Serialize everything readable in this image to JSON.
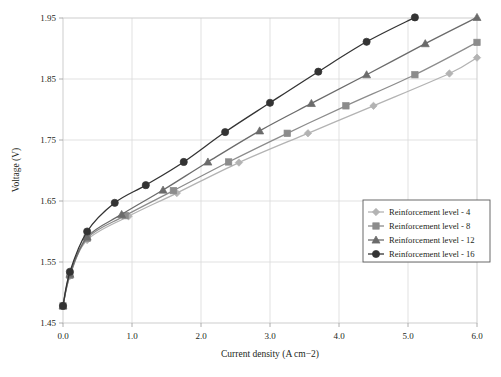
{
  "chart_data": {
    "type": "line",
    "title": "",
    "xlabel": "Current density (A cm−2)",
    "ylabel": "Voltage (V)",
    "xlim": [
      0.0,
      6.0
    ],
    "ylim": [
      1.45,
      1.95
    ],
    "xticks": [
      "0.0",
      "1.0",
      "2.0",
      "3.0",
      "4.0",
      "5.0",
      "6.0"
    ],
    "yticks": [
      "1.45",
      "1.55",
      "1.65",
      "1.75",
      "1.85",
      "1.95"
    ],
    "grid": true,
    "legend_position": "lower right",
    "series": [
      {
        "name": "Reinforcement level - 4",
        "marker": "diamond",
        "color": "#b3b3b3",
        "x": [
          0.0,
          0.1,
          0.35,
          0.95,
          1.65,
          2.55,
          3.55,
          4.5,
          5.6,
          6.0
        ],
        "y": [
          1.478,
          1.527,
          1.586,
          1.625,
          1.663,
          1.713,
          1.761,
          1.806,
          1.859,
          1.885
        ]
      },
      {
        "name": "Reinforcement level - 8",
        "marker": "square",
        "color": "#8c8c8c",
        "x": [
          0.0,
          0.1,
          0.35,
          0.9,
          1.6,
          2.4,
          3.25,
          4.1,
          5.1,
          6.0
        ],
        "y": [
          1.478,
          1.528,
          1.589,
          1.626,
          1.667,
          1.714,
          1.761,
          1.806,
          1.857,
          1.91
        ]
      },
      {
        "name": "Reinforcement level - 12",
        "marker": "triangle",
        "color": "#6b6b6b",
        "x": [
          0.0,
          0.1,
          0.35,
          0.85,
          1.45,
          2.1,
          2.85,
          3.6,
          4.4,
          5.25,
          6.0
        ],
        "y": [
          1.478,
          1.53,
          1.591,
          1.628,
          1.668,
          1.714,
          1.765,
          1.81,
          1.857,
          1.908,
          1.951
        ]
      },
      {
        "name": "Reinforcement level - 16",
        "marker": "circle",
        "color": "#333333",
        "x": [
          0.0,
          0.1,
          0.35,
          0.75,
          1.2,
          1.75,
          2.35,
          3.0,
          3.7,
          4.4,
          5.1
        ],
        "y": [
          1.478,
          1.534,
          1.6,
          1.647,
          1.676,
          1.714,
          1.763,
          1.811,
          1.862,
          1.911,
          1.951
        ]
      }
    ]
  },
  "legend": {
    "entries": [
      {
        "label": "Reinforcement level - 4"
      },
      {
        "label": "Reinforcement level - 8"
      },
      {
        "label": "Reinforcement level - 12"
      },
      {
        "label": "Reinforcement level - 16"
      }
    ]
  }
}
